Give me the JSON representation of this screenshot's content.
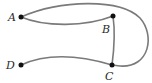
{
  "diagram": {
    "type": "graph",
    "nodes": [
      {
        "id": "A",
        "label": "A",
        "x": 21,
        "y": 17,
        "lx": 8,
        "ly": 21
      },
      {
        "id": "B",
        "label": "B",
        "x": 113,
        "y": 16,
        "lx": 102,
        "ly": 33
      },
      {
        "id": "C",
        "label": "C",
        "x": 112,
        "y": 65,
        "lx": 105,
        "ly": 80
      },
      {
        "id": "D",
        "label": "D",
        "x": 21,
        "y": 65,
        "lx": 6,
        "ly": 69
      }
    ],
    "edges": [
      {
        "from": "A",
        "to": "B",
        "kind": "lower-curve"
      },
      {
        "from": "A",
        "to": "C",
        "kind": "outer-loop"
      },
      {
        "from": "B",
        "to": "C",
        "kind": "straight"
      },
      {
        "from": "D",
        "to": "C",
        "kind": "curve"
      }
    ],
    "colors": {
      "edge": "#7a7a7a",
      "node": "#111111",
      "label": "#2a2a2a"
    }
  }
}
